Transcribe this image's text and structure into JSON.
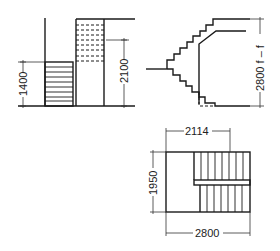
{
  "diagram": {
    "type": "staircase technical drawing",
    "views": [
      {
        "name": "section-elevation",
        "dimensions": [
          {
            "label": "1400",
            "orientation": "vertical"
          },
          {
            "label": "2100",
            "orientation": "vertical"
          }
        ]
      },
      {
        "name": "side-section",
        "dimensions": [
          {
            "label": "2800 f – f",
            "orientation": "vertical"
          }
        ]
      },
      {
        "name": "plan-view",
        "dimensions": [
          {
            "label": "2114",
            "orientation": "horizontal"
          },
          {
            "label": "1950",
            "orientation": "vertical"
          },
          {
            "label": "2800",
            "orientation": "horizontal"
          }
        ]
      }
    ]
  },
  "labels": {
    "dim_1400": "1400",
    "dim_2100": "2100",
    "dim_2800ff": "2800 f – f",
    "dim_2114": "2114",
    "dim_1950": "1950",
    "dim_2800": "2800"
  },
  "colors": {
    "line": "#1a1a1a",
    "background": "#ffffff"
  }
}
